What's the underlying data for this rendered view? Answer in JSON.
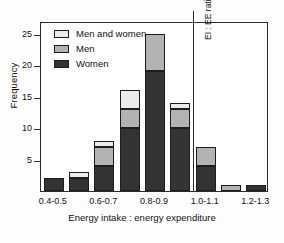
{
  "chart_data": {
    "type": "bar",
    "title": "",
    "subtitle": "",
    "xlabel": "Energy intake : energy expenditure",
    "ylabel": "Frequency",
    "categories": [
      "0.4-0.5",
      "0.5-0.6",
      "0.6-0.7",
      "0.7-0.8",
      "0.8-0.9",
      "0.9-1.0",
      "1.0-1.1",
      "1.1-1.2",
      "1.2-1.3"
    ],
    "visible_tick_labels": [
      "0.4-0.5",
      "0.6-0.7",
      "0.8-0.9",
      "1.0-1.1",
      "1.2-1.3"
    ],
    "visible_tick_indices": [
      0,
      2,
      4,
      6,
      8
    ],
    "stacked": true,
    "series": [
      {
        "name": "Women",
        "color": "#333333",
        "values": [
          2,
          2,
          4,
          10,
          19,
          10,
          4,
          0,
          1
        ]
      },
      {
        "name": "Men",
        "color": "#b3b3b3",
        "values": [
          0,
          0,
          3,
          3,
          6,
          3,
          3,
          1,
          0
        ]
      },
      {
        "name": "Men and women",
        "color": "#ebebeb",
        "values": [
          0,
          1,
          1,
          3,
          0,
          1,
          0,
          0,
          0
        ]
      }
    ],
    "totals": [
      2,
      3,
      8,
      16,
      25,
      14,
      7,
      1,
      1
    ],
    "ylim": [
      0,
      27
    ],
    "yticks": [
      5,
      10,
      15,
      20,
      25
    ],
    "ytick_labels": [
      "5",
      "10",
      "15",
      "20",
      "25"
    ],
    "grid": false,
    "legend_position": "top-left",
    "legend_entries": [
      "Men and women",
      "Men",
      "Women"
    ],
    "annotations": [
      {
        "text": "EI : EE ratio = 1.0",
        "at_category_boundary": "1.0",
        "orientation": "vertical"
      }
    ]
  },
  "legend": {
    "items": [
      {
        "label": "Men and women",
        "key": "both"
      },
      {
        "label": "Men",
        "key": "men"
      },
      {
        "label": "Women",
        "key": "women"
      }
    ]
  },
  "axes": {
    "y_title": "Frequency",
    "x_title": "Energy intake : energy expenditure"
  },
  "annotation": {
    "ref_line_label": "EI : EE ratio = 1.0"
  }
}
